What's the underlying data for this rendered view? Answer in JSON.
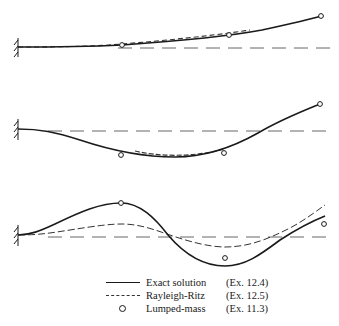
{
  "figure": {
    "type": "beam mode shapes comparison",
    "modes": [
      {
        "name": "mode-1",
        "baseline_y": 48
      },
      {
        "name": "mode-2",
        "baseline_y": 131
      },
      {
        "name": "mode-3",
        "baseline_y": 237
      }
    ]
  },
  "legend": {
    "items": [
      {
        "symbol": "solid-line",
        "label": "Exact solution",
        "ref": "(Ex. 12.4)"
      },
      {
        "symbol": "dashed-line",
        "label": "Rayleigh-Ritz",
        "ref": "(Ex. 12.5)"
      },
      {
        "symbol": "open-circle",
        "label": "Lumped-mass",
        "ref": "(Ex. 11.3)"
      }
    ]
  },
  "colors": {
    "ink": "#1a1a1a",
    "dashed": "#555555",
    "background": "#ffffff"
  }
}
